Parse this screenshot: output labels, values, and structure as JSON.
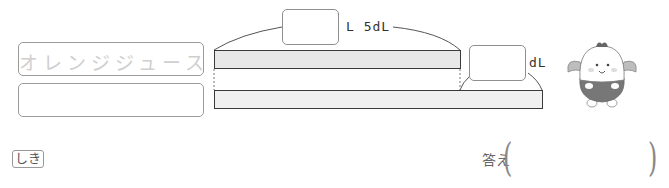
{
  "diagram": {
    "labels": [
      {
        "text": "オレンジジュース",
        "state": "faded"
      },
      {
        "text": "",
        "state": "empty"
      }
    ],
    "bars": {
      "top": {
        "x1": 214,
        "x2": 460
      },
      "bottom": {
        "x1": 214,
        "x2": 542
      }
    },
    "top_brace": {
      "answer_box": "",
      "unit_text": "L 5dL"
    },
    "diff_brace": {
      "answer_box": "",
      "unit_text": "dL"
    }
  },
  "formula": {
    "label": "しき"
  },
  "answer": {
    "label": "答え",
    "open_paren": "(",
    "close_paren": ")",
    "value": ""
  },
  "character": {
    "icon": "mascot-icon"
  },
  "colors": {
    "bar_border": "#3a3a3a",
    "bar_fill_top": "#e8e8e8",
    "bar_fill_bottom": "#f0f0f0",
    "box_border": "#8f8f8f",
    "faded_text": "#cfcfcf"
  }
}
